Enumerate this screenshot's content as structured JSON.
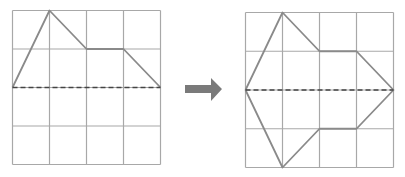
{
  "figure": {
    "colors": {
      "grid": "#a8a8a8",
      "shape": "#8a8a8a",
      "axis": "#444444",
      "arrow": "#7a7a7a",
      "background": "#ffffff"
    },
    "left_grid": {
      "rows": 4,
      "cols": 4,
      "axis_row": 2,
      "shape_points_grid_units": [
        [
          0,
          2
        ],
        [
          1,
          0
        ],
        [
          2,
          1
        ],
        [
          3,
          1
        ],
        [
          4,
          2
        ]
      ]
    },
    "arrow": {
      "direction": "right",
      "icon": "right-arrow-icon"
    },
    "right_grid": {
      "rows": 4,
      "cols": 4,
      "axis_row": 2,
      "shape_points_grid_units": [
        [
          0,
          2
        ],
        [
          1,
          0
        ],
        [
          2,
          1
        ],
        [
          3,
          1
        ],
        [
          4,
          2
        ],
        [
          3,
          3
        ],
        [
          2,
          3
        ],
        [
          1,
          4
        ],
        [
          0,
          2
        ]
      ]
    }
  }
}
